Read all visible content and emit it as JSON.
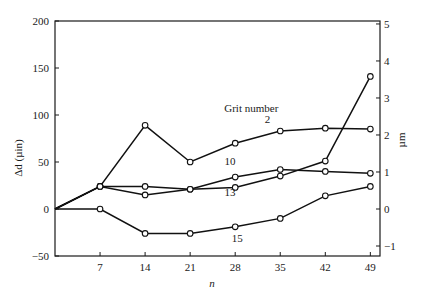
{
  "chart_data": {
    "type": "line",
    "title": "",
    "xlabel": "n",
    "ylabel": "Δd (µin)",
    "ylabel_right": "µm",
    "x": [
      0,
      7,
      14,
      21,
      28,
      35,
      42,
      49
    ],
    "x_ticks": [
      7,
      14,
      21,
      28,
      35,
      42,
      49
    ],
    "xlim": [
      0,
      50.5
    ],
    "ylim": [
      -50,
      200
    ],
    "y_ticks": [
      -50,
      0,
      50,
      100,
      150,
      200
    ],
    "ylim_right": [
      -1.27,
      5.08
    ],
    "y_ticks_right": [
      -1,
      0,
      1,
      2,
      3,
      4,
      5
    ],
    "grid": false,
    "legend_title": "Grit number",
    "series": [
      {
        "name": "2",
        "values": [
          0,
          24,
          89,
          50,
          70,
          83,
          86,
          85
        ]
      },
      {
        "name": "10",
        "values": [
          0,
          24,
          24,
          21,
          34,
          42,
          40,
          38
        ]
      },
      {
        "name": "13",
        "values": [
          0,
          24,
          15,
          21,
          23,
          35,
          51,
          141
        ]
      },
      {
        "name": "15",
        "values": [
          0,
          0,
          -26,
          -26,
          -19,
          -10,
          14,
          24
        ]
      }
    ],
    "annotations": [
      {
        "text": "Grit number",
        "x": 30.5,
        "y": 103
      },
      {
        "text": "2",
        "x": 33,
        "y": 91
      },
      {
        "text": "10",
        "x": 27.2,
        "y": 47
      },
      {
        "text": "13",
        "x": 27.2,
        "y": 14
      },
      {
        "text": "15",
        "x": 28.3,
        "y": -35
      }
    ]
  }
}
